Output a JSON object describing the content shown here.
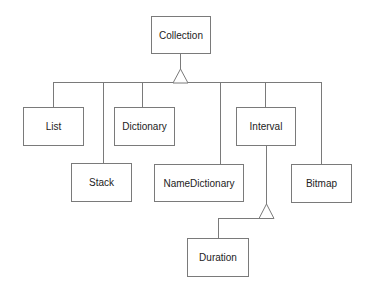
{
  "diagram": {
    "type": "class-hierarchy",
    "colors": {
      "line": "#7a7a7a",
      "text": "#222222",
      "background": "#ffffff"
    },
    "root": {
      "id": "collection",
      "label": "Collection"
    },
    "classes": [
      {
        "id": "collection",
        "label": "Collection"
      },
      {
        "id": "list",
        "label": "List"
      },
      {
        "id": "stack",
        "label": "Stack"
      },
      {
        "id": "dictionary",
        "label": "Dictionary"
      },
      {
        "id": "namedictionary",
        "label": "NameDictionary"
      },
      {
        "id": "interval",
        "label": "Interval"
      },
      {
        "id": "bitmap",
        "label": "Bitmap"
      },
      {
        "id": "duration",
        "label": "Duration"
      }
    ],
    "inheritance": [
      {
        "parent": "Collection",
        "children": [
          "List",
          "Stack",
          "Dictionary",
          "NameDictionary",
          "Interval",
          "Bitmap"
        ]
      },
      {
        "parent": "Interval",
        "children": [
          "Duration"
        ]
      }
    ]
  }
}
